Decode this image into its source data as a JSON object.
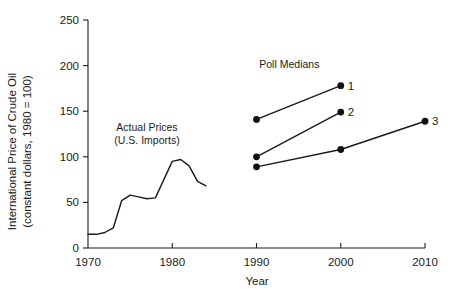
{
  "chart_data": {
    "type": "line",
    "title": "",
    "xlabel": "Year",
    "ylabel_line1": "International Price of Crude Oil",
    "ylabel_line2": "(constant dollars, 1980 = 100)",
    "xlim": [
      1970,
      2010
    ],
    "ylim": [
      0,
      250
    ],
    "xticks": [
      1970,
      1980,
      1990,
      2000,
      2010
    ],
    "xtick_labels": [
      "1970",
      "1980",
      "1990",
      "2000",
      "2010"
    ],
    "yticks": [
      0,
      50,
      100,
      150,
      200,
      250
    ],
    "ytick_labels": [
      "0",
      "50",
      "100",
      "150",
      "200",
      "250"
    ],
    "grid": false,
    "legend_position": "none",
    "annotations": [
      {
        "name": "actual-prices",
        "line1": "Actual Prices",
        "line2": "(U.S. Imports)",
        "x": 1977.0,
        "y": 128
      },
      {
        "name": "poll-medians",
        "text": "Poll Medians",
        "x": 1993.9,
        "y": 197
      }
    ],
    "series": [
      {
        "name": "Actual Prices (U.S. Imports)",
        "label": "",
        "markers": false,
        "x": [
          1970,
          1971,
          1972,
          1973,
          1974,
          1975,
          1976,
          1977,
          1978,
          1979,
          1980,
          1981,
          1982,
          1983,
          1984
        ],
        "values": [
          15,
          15,
          17,
          22,
          52,
          58,
          56,
          54,
          55,
          75,
          95,
          97,
          90,
          73,
          68
        ]
      },
      {
        "name": "Poll Median 1",
        "label": "1",
        "markers": true,
        "x": [
          1990,
          2000
        ],
        "values": [
          141,
          178
        ]
      },
      {
        "name": "Poll Median 2",
        "label": "2",
        "markers": true,
        "x": [
          1990,
          2000
        ],
        "values": [
          100,
          149
        ]
      },
      {
        "name": "Poll Median 3",
        "label": "3",
        "markers": true,
        "x": [
          1990,
          2000,
          2010
        ],
        "values": [
          89,
          108,
          139
        ]
      }
    ],
    "colors": {
      "line": "#1a1a1a",
      "marker": "#111111",
      "axis": "#1a1a1a",
      "background": "#ffffff"
    }
  }
}
